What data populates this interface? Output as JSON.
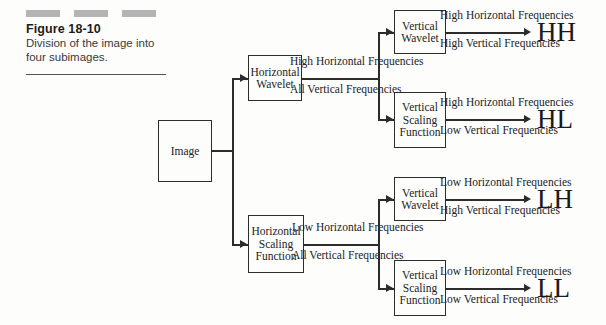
{
  "caption": {
    "figure_number": "Figure 18-10",
    "description": "Division of the image into four subimages.",
    "dash_count": 3
  },
  "diagram": {
    "source_box": "Image",
    "stage1": [
      {
        "label": "Horizontal Wavelet",
        "upper": "High Horizontal Frequencies",
        "lower": "All Vertical Frequencies"
      },
      {
        "label": "Horizontal Scaling Function",
        "upper": "Low Horizontal Frequencies",
        "lower": "All Vertical Frequencies"
      }
    ],
    "stage2": [
      {
        "label": "Vertical Wavelet",
        "upper": "High Horizontal Frequencies",
        "lower": "High Vertical Frequencies",
        "result": "HH"
      },
      {
        "label": "Vertical Scaling Function",
        "upper": "High Horizontal Frequencies",
        "lower": "Low Vertical Frequencies",
        "result": "HL"
      },
      {
        "label": "Vertical Wavelet",
        "upper": "Low Horizontal Frequencies",
        "lower": "High Vertical Frequencies",
        "result": "LH"
      },
      {
        "label": "Vertical Scaling Function",
        "upper": "Low Horizontal Frequencies",
        "lower": "Low Vertical Frequencies",
        "result": "LL"
      }
    ]
  },
  "colors": {
    "ink": "#2c2c2c",
    "dash": "#b4b4b4",
    "background": "#fdfdfc"
  }
}
